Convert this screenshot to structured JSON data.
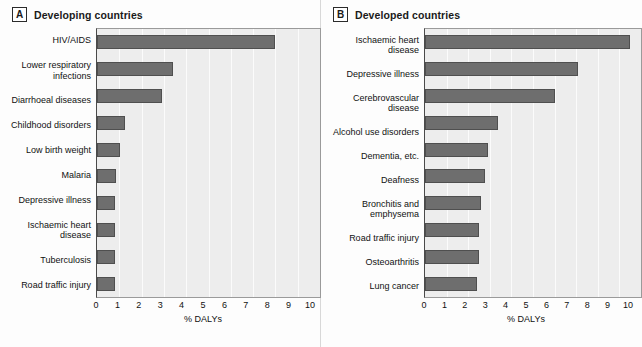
{
  "figure": {
    "panels": [
      {
        "letter": "A",
        "title": "Developing countries",
        "axis_title": "% DALYs"
      },
      {
        "letter": "B",
        "title": "Developed countries",
        "axis_title": "% DALYs"
      }
    ],
    "tick_labels": [
      "0",
      "1",
      "2",
      "3",
      "4",
      "5",
      "6",
      "7",
      "8",
      "9",
      "10"
    ]
  },
  "colors": {
    "bar_fill": "#6e6e6e",
    "bar_border": "#4f4f4f",
    "plot_background": "#ededed",
    "grid_line": "#fbfbfb",
    "page_background": "#ffffff"
  },
  "chart_data": [
    {
      "type": "bar",
      "orientation": "horizontal",
      "panel": "A",
      "title": "Developing countries",
      "xlabel": "% DALYs",
      "ylabel": "",
      "xlim": [
        0,
        10
      ],
      "xticks": [
        0,
        1,
        2,
        3,
        4,
        5,
        6,
        7,
        8,
        9,
        10
      ],
      "grid": true,
      "legend": "none",
      "categories": [
        "HIV/AIDS",
        "Lower respiratory\ninfections",
        "Diarrhoeal diseases",
        "Childhood disorders",
        "Low birth weight",
        "Malaria",
        "Depressive illness",
        "Ischaemic heart\ndisease",
        "Tuberculosis",
        "Road traffic injury"
      ],
      "values": [
        8.0,
        3.4,
        2.9,
        1.25,
        1.05,
        0.85,
        0.8,
        0.8,
        0.8,
        0.8
      ]
    },
    {
      "type": "bar",
      "orientation": "horizontal",
      "panel": "B",
      "title": "Developed countries",
      "xlabel": "% DALYs",
      "ylabel": "",
      "xlim": [
        0,
        10
      ],
      "xticks": [
        0,
        1,
        2,
        3,
        4,
        5,
        6,
        7,
        8,
        9,
        10
      ],
      "grid": true,
      "legend": "none",
      "categories": [
        "Ischaemic heart\ndisease",
        "Depressive illness",
        "Cerebrovascular\ndisease",
        "Alcohol use disorders",
        "Dementia, etc.",
        "Deafness",
        "Bronchitis and\nemphysema",
        "Road traffic injury",
        "Osteoarthritis",
        "Lung cancer"
      ],
      "values": [
        9.5,
        7.1,
        6.0,
        3.4,
        2.9,
        2.8,
        2.6,
        2.5,
        2.5,
        2.4
      ]
    }
  ]
}
